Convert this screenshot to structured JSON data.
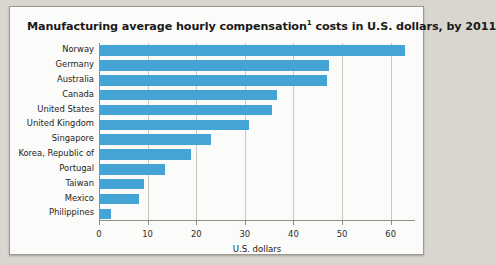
{
  "figure": {
    "title_main": "Manufacturing average hourly compensation",
    "title_superscript": "1",
    "title_rest": " costs in U.S. dollars, by 2011",
    "background_color": "#fbfbf9",
    "page_background_color": "#d9d6cf",
    "border_color": "#9a9a92"
  },
  "chart_data": {
    "type": "bar",
    "orientation": "horizontal",
    "xlabel": "U.S. dollars",
    "ylabel": "",
    "categories": [
      "Norway",
      "Germany",
      "Australia",
      "Canada",
      "United States",
      "United Kingdom",
      "Singapore",
      "Korea, Republic of",
      "Portugal",
      "Taiwan",
      "Mexico",
      "Philippines"
    ],
    "values": [
      63.0,
      47.4,
      46.8,
      36.6,
      35.5,
      30.8,
      23.1,
      18.9,
      13.6,
      9.3,
      8.2,
      2.4
    ],
    "xlim": [
      0,
      65
    ],
    "xticks": [
      0,
      10,
      20,
      30,
      40,
      50,
      60
    ],
    "xticklabels": [
      "0",
      "10",
      "20",
      "30",
      "40",
      "50",
      "60"
    ],
    "grid": true,
    "grid_axis": "x",
    "legend": null,
    "bar_color": "#45a4d6",
    "gridline_color": "#c9c9c4",
    "axis_color": "#8e8e88"
  }
}
